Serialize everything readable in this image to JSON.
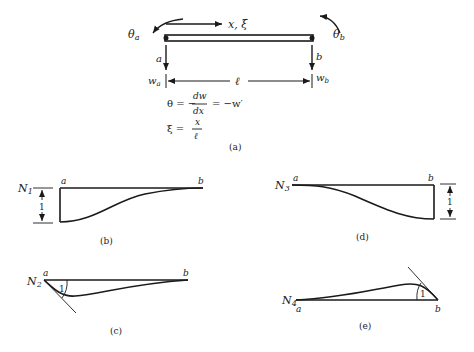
{
  "figure": {
    "panel_a": {
      "caption": "(a)",
      "theta_a": "θ",
      "theta_a_sub": "a",
      "theta_b": "θ",
      "theta_b_sub": "b",
      "axis_label": "x, ξ",
      "node_a": "a",
      "node_b": "b",
      "w_a": "w",
      "w_a_sub": "a",
      "w_b": "w",
      "w_b_sub": "b",
      "length": "ℓ",
      "eq1_lhs": "θ = −",
      "eq1_num": "dw",
      "eq1_den": "dx",
      "eq1_rhs": "= −w′",
      "eq2_lhs": "ξ =",
      "eq2_num": "x",
      "eq2_den": "ℓ"
    },
    "panel_b": {
      "caption": "(b)",
      "shape_fn": "N",
      "shape_sub": "1",
      "node_a": "a",
      "node_b": "b",
      "magnitude": "1"
    },
    "panel_c": {
      "caption": "(c)",
      "shape_fn": "N",
      "shape_sub": "2",
      "node_a": "a",
      "node_b": "b",
      "slope": "1"
    },
    "panel_d": {
      "caption": "(d)",
      "shape_fn": "N",
      "shape_sub": "3",
      "node_a": "a",
      "node_b": "b",
      "magnitude": "1"
    },
    "panel_e": {
      "caption": "(e)",
      "shape_fn": "N",
      "shape_sub": "4",
      "node_a": "a",
      "node_b": "b",
      "slope": "1"
    }
  }
}
